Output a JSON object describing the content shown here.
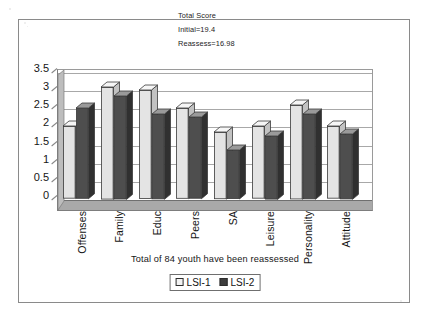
{
  "figure": {
    "frame_border_color": "#8a8a8a",
    "background": "#ffffff"
  },
  "header": {
    "line1": "Total Score",
    "line2": "Initial=19.4",
    "line3": "Reassess=16.98"
  },
  "caption": {
    "text": "Total of  84 youth have been reassessed"
  },
  "legend": {
    "position": "bottom-center",
    "items": [
      {
        "label": "LSI-1",
        "swatch": "light",
        "color": "#f2f2f2"
      },
      {
        "label": "LSI-2",
        "swatch": "dark",
        "color": "#3d3d3d"
      }
    ]
  },
  "chart_data": {
    "type": "bar",
    "title": "Total Score",
    "subtitle": "Initial=19.4 / Reassess=16.98",
    "xlabel": "",
    "ylabel": "",
    "ylim": [
      0,
      3.5
    ],
    "yticks": [
      "0",
      "0.5",
      "1",
      "1.5",
      "2",
      "2.5",
      "3",
      "3.5"
    ],
    "ytick_values": [
      0,
      0.5,
      1,
      1.5,
      2,
      2.5,
      3,
      3.5
    ],
    "grid": true,
    "three_d": true,
    "legend_position": "bottom-center",
    "categories": [
      "Offenses",
      "Family",
      "Educ",
      "Peers",
      "SA",
      "Leisure",
      "Personality",
      "Attitude"
    ],
    "series": [
      {
        "name": "LSI-1",
        "color": "#e4e4e4",
        "values": [
          2.0,
          3.1,
          3.0,
          2.5,
          1.85,
          2.0,
          2.6,
          2.0
        ]
      },
      {
        "name": "LSI-2",
        "color": "#4e4e4e",
        "values": [
          2.5,
          2.85,
          2.35,
          2.25,
          1.35,
          1.75,
          2.35,
          1.8
        ]
      }
    ],
    "annotations": [
      "Total Score",
      "Initial=19.4",
      "Reassess=16.98",
      "Total of  84 youth have been reassessed"
    ]
  }
}
